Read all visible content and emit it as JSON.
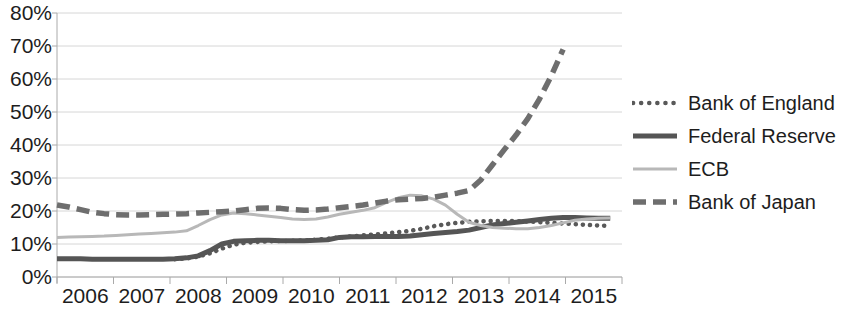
{
  "chart_data": {
    "type": "line",
    "title": "",
    "subtitle": "",
    "xlabel": "",
    "ylabel": "",
    "xlim": [
      2006.0,
      2015.6
    ],
    "ylim": [
      0,
      80
    ],
    "y_tick_labels": [
      "80%",
      "70%",
      "60%",
      "50%",
      "40%",
      "30%",
      "20%",
      "10%",
      "0%"
    ],
    "y_tick_values": [
      80,
      70,
      60,
      50,
      40,
      30,
      20,
      10,
      0
    ],
    "x_tick_labels": [
      "2006",
      "2007",
      "2008",
      "2009",
      "2010",
      "2011",
      "2012",
      "2013",
      "2014",
      "2015"
    ],
    "x_tick_values": [
      2006,
      2007,
      2008,
      2009,
      2010,
      2011,
      2012,
      2013,
      2014,
      2015
    ],
    "grid": true,
    "grid_axis": "y",
    "legend_position": "right",
    "y_unit": "percent",
    "series": [
      {
        "name": "Bank of England",
        "style": "dotted",
        "color": "#595959",
        "x": [
          2008.0,
          2008.2,
          2008.4,
          2008.6,
          2008.8,
          2009.0,
          2009.2,
          2009.4,
          2009.6,
          2009.8,
          2010.0,
          2010.2,
          2010.4,
          2010.6,
          2010.8,
          2011.0,
          2011.2,
          2011.4,
          2011.6,
          2011.8,
          2012.0,
          2012.2,
          2012.4,
          2012.6,
          2012.8,
          2013.0,
          2013.2,
          2013.4,
          2013.6,
          2013.8,
          2014.0,
          2014.2,
          2014.4,
          2014.6,
          2014.8,
          2015.0,
          2015.2,
          2015.4
        ],
        "values": [
          5.4,
          5.6,
          6.2,
          7.2,
          8.6,
          9.8,
          10.4,
          10.6,
          10.8,
          10.9,
          11.0,
          11.1,
          11.3,
          11.6,
          12.0,
          12.3,
          12.6,
          12.9,
          13.2,
          13.6,
          14.0,
          14.6,
          15.4,
          16.0,
          16.4,
          16.7,
          16.9,
          17.0,
          17.0,
          16.9,
          16.8,
          16.6,
          16.4,
          16.2,
          16.0,
          15.8,
          15.6,
          15.5
        ]
      },
      {
        "name": "Federal Reserve",
        "style": "solid-dark",
        "color": "#555555",
        "x": [
          2006.0,
          2006.2,
          2006.4,
          2006.6,
          2006.8,
          2007.0,
          2007.2,
          2007.4,
          2007.6,
          2007.8,
          2008.0,
          2008.2,
          2008.4,
          2008.6,
          2008.8,
          2009.0,
          2009.2,
          2009.4,
          2009.6,
          2009.8,
          2010.0,
          2010.2,
          2010.4,
          2010.6,
          2010.8,
          2011.0,
          2011.2,
          2011.4,
          2011.6,
          2011.8,
          2012.0,
          2012.2,
          2012.4,
          2012.6,
          2012.8,
          2013.0,
          2013.2,
          2013.4,
          2013.6,
          2013.8,
          2014.0,
          2014.2,
          2014.4,
          2014.6,
          2014.8,
          2015.0,
          2015.2,
          2015.4
        ],
        "values": [
          5.5,
          5.5,
          5.5,
          5.4,
          5.4,
          5.4,
          5.4,
          5.4,
          5.4,
          5.4,
          5.5,
          5.8,
          6.4,
          8.0,
          10.0,
          10.8,
          11.0,
          11.1,
          11.1,
          11.0,
          11.0,
          11.0,
          11.1,
          11.3,
          12.0,
          12.2,
          12.2,
          12.3,
          12.3,
          12.3,
          12.4,
          12.8,
          13.2,
          13.5,
          13.8,
          14.2,
          15.0,
          15.8,
          16.2,
          16.6,
          17.0,
          17.4,
          17.8,
          18.0,
          18.0,
          17.9,
          17.8,
          17.8
        ]
      },
      {
        "name": "ECB",
        "style": "solid-light",
        "color": "#b8b8b8",
        "x": [
          2006.0,
          2006.2,
          2006.4,
          2006.6,
          2006.8,
          2007.0,
          2007.2,
          2007.4,
          2007.6,
          2007.8,
          2008.0,
          2008.2,
          2008.4,
          2008.6,
          2008.8,
          2009.0,
          2009.2,
          2009.4,
          2009.6,
          2009.8,
          2010.0,
          2010.2,
          2010.4,
          2010.6,
          2010.8,
          2011.0,
          2011.2,
          2011.4,
          2011.6,
          2011.8,
          2012.0,
          2012.2,
          2012.4,
          2012.6,
          2012.8,
          2013.0,
          2013.2,
          2013.4,
          2013.6,
          2013.8,
          2014.0,
          2014.2,
          2014.4,
          2014.6,
          2014.8,
          2015.0,
          2015.2,
          2015.4
        ],
        "values": [
          12.0,
          12.1,
          12.2,
          12.3,
          12.4,
          12.6,
          12.8,
          13.0,
          13.2,
          13.4,
          13.6,
          14.0,
          15.6,
          17.4,
          18.8,
          19.4,
          19.2,
          18.8,
          18.4,
          18.0,
          17.6,
          17.4,
          17.6,
          18.2,
          19.0,
          19.6,
          20.2,
          21.0,
          22.6,
          24.0,
          24.8,
          24.6,
          23.6,
          21.8,
          19.0,
          16.6,
          15.6,
          15.0,
          14.8,
          14.6,
          14.6,
          15.0,
          15.6,
          16.4,
          17.2,
          17.6,
          17.8,
          17.9
        ]
      },
      {
        "name": "Bank of Japan",
        "style": "dashed",
        "color": "#6e6e6e",
        "x": [
          2006.0,
          2006.2,
          2006.4,
          2006.6,
          2006.8,
          2007.0,
          2007.2,
          2007.4,
          2007.6,
          2007.8,
          2008.0,
          2008.2,
          2008.4,
          2008.6,
          2008.8,
          2009.0,
          2009.2,
          2009.4,
          2009.6,
          2009.8,
          2010.0,
          2010.2,
          2010.4,
          2010.6,
          2010.8,
          2011.0,
          2011.2,
          2011.4,
          2011.6,
          2011.8,
          2012.0,
          2012.2,
          2012.4,
          2012.6,
          2012.8,
          2013.0,
          2013.2,
          2013.4,
          2013.6,
          2013.8,
          2014.0,
          2014.2,
          2014.4,
          2014.6
        ],
        "values": [
          21.8,
          21.2,
          20.4,
          19.6,
          19.2,
          18.9,
          18.8,
          18.8,
          18.9,
          19.0,
          19.1,
          19.2,
          19.4,
          19.6,
          19.8,
          20.0,
          20.4,
          20.8,
          20.9,
          20.8,
          20.4,
          20.2,
          20.3,
          20.6,
          21.0,
          21.4,
          21.8,
          22.4,
          23.0,
          23.4,
          23.6,
          23.8,
          24.2,
          24.8,
          25.4,
          26.2,
          29.4,
          34.0,
          38.6,
          43.0,
          48.0,
          54.0,
          61.0,
          69.0
        ]
      }
    ]
  },
  "axis": {
    "axis_color": "#aaaaaa",
    "grid_color": "#d6d6d6",
    "text_color": "#1d1d1d"
  },
  "legend": {
    "items": [
      {
        "label": "Bank of England"
      },
      {
        "label": "Federal Reserve"
      },
      {
        "label": "ECB"
      },
      {
        "label": "Bank of Japan"
      }
    ]
  }
}
